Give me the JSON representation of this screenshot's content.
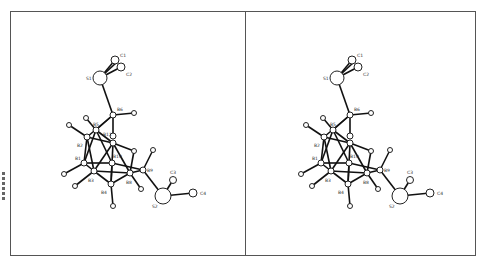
{
  "figure": {
    "type": "stereo-pair molecular structure (ball-and-stick)",
    "panels": [
      "left",
      "right"
    ]
  },
  "labels": {
    "S1": "S1",
    "C1": "C1",
    "C2": "C2",
    "B6": "B6",
    "B5": "B5",
    "B2": "B2",
    "B1": "B1",
    "B3": "B3",
    "B4": "B4",
    "B8": "B8",
    "B9": "B9",
    "B10": "B10",
    "B11": "B11",
    "S2": "S2",
    "C3": "C3",
    "C4": "C4"
  },
  "atoms": [
    {
      "id": "S1",
      "x": 100,
      "y": 78,
      "r": 7
    },
    {
      "id": "C1",
      "x": 115,
      "y": 60,
      "r": 4
    },
    {
      "id": "C2",
      "x": 121,
      "y": 67,
      "r": 4
    },
    {
      "id": "B6",
      "x": 113,
      "y": 115,
      "r": 3
    },
    {
      "id": "H6",
      "x": 134,
      "y": 113,
      "r": 2.5
    },
    {
      "id": "B5",
      "x": 96,
      "y": 130,
      "r": 3
    },
    {
      "id": "H5",
      "x": 86,
      "y": 118,
      "r": 2.5
    },
    {
      "id": "H2",
      "x": 69,
      "y": 125,
      "r": 2.5
    },
    {
      "id": "B2",
      "x": 87,
      "y": 137,
      "r": 3
    },
    {
      "id": "B11",
      "x": 113,
      "y": 136,
      "r": 3
    },
    {
      "id": "B7",
      "x": 114,
      "y": 143,
      "r": 3
    },
    {
      "id": "H7",
      "x": 134,
      "y": 151,
      "r": 2.5
    },
    {
      "id": "B1",
      "x": 84,
      "y": 163,
      "r": 3
    },
    {
      "id": "H1",
      "x": 64,
      "y": 174,
      "r": 2.5
    },
    {
      "id": "B10",
      "x": 112,
      "y": 163,
      "r": 3
    },
    {
      "id": "B3",
      "x": 94,
      "y": 171,
      "r": 3
    },
    {
      "id": "H3",
      "x": 75,
      "y": 186,
      "r": 2.5
    },
    {
      "id": "B4",
      "x": 111,
      "y": 184,
      "r": 3
    },
    {
      "id": "H4",
      "x": 113,
      "y": 206,
      "r": 2.5
    },
    {
      "id": "B8",
      "x": 130,
      "y": 173,
      "r": 3
    },
    {
      "id": "H8",
      "x": 141,
      "y": 189,
      "r": 2.5
    },
    {
      "id": "B9",
      "x": 143,
      "y": 170,
      "r": 3
    },
    {
      "id": "H9",
      "x": 153,
      "y": 150,
      "r": 2.5
    },
    {
      "id": "S2",
      "x": 163,
      "y": 196,
      "r": 8
    },
    {
      "id": "C3",
      "x": 173,
      "y": 180,
      "r": 3.5
    },
    {
      "id": "C4",
      "x": 193,
      "y": 193,
      "r": 4
    }
  ]
}
